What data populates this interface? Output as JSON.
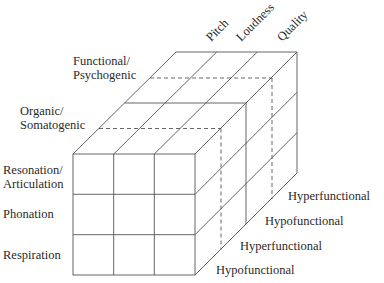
{
  "diagram": {
    "type": "3d-cube-classification",
    "top_axis": {
      "labels": [
        "Pitch",
        "Loudness",
        "Quality"
      ]
    },
    "left_depth_axis": {
      "labels": [
        {
          "line1": "Functional/",
          "line2": "Psychogenic"
        },
        {
          "line1": "Organic/",
          "line2": "Somatogenic"
        }
      ]
    },
    "front_rows": {
      "labels": [
        {
          "line1": "Resonation/",
          "line2": "Articulation"
        },
        {
          "line1": "Phonation",
          "line2": ""
        },
        {
          "line1": "Respiration",
          "line2": ""
        }
      ]
    },
    "depth_slices": {
      "labels": [
        "Hyperfunctional",
        "Hypofunctional",
        "Hyperfunctional",
        "Hypofunctional"
      ]
    },
    "colors": {
      "line": "#555555",
      "text": "#2a2a2a",
      "background": "#ffffff"
    }
  }
}
